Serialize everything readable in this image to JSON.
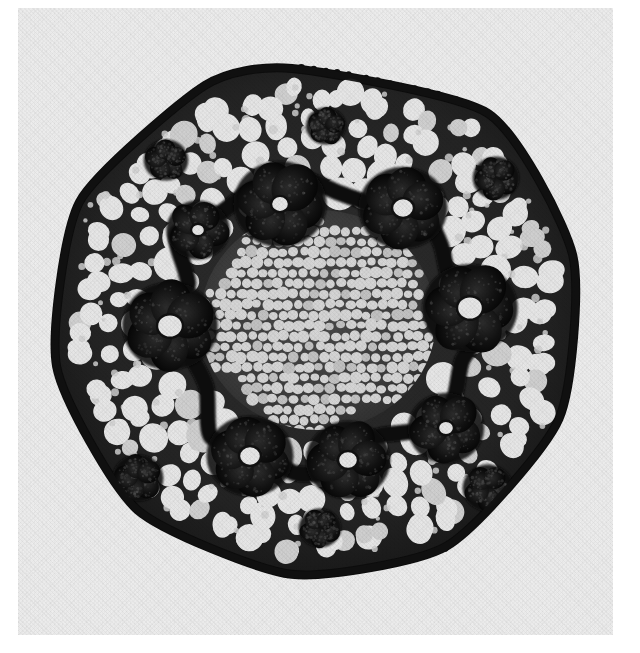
{
  "image": {
    "kind": "photomicrograph",
    "subject": "plant stem cross section",
    "rendering": "monochrome-grayscale",
    "width": 640,
    "height": 653,
    "plate": {
      "x": 18,
      "y": 8,
      "width": 595,
      "height": 627
    },
    "colors": {
      "page": "#ffffff",
      "print_background": "#efefef",
      "print_background_shadow": "#e4e4e4",
      "tissue_mesh_dark": "#141414",
      "tissue_mesh_mid": "#3a3a3a",
      "cortex_cell_lumen": "#e9e9e9",
      "cortex_cell_lumen_shaded": "#d2d2d2",
      "pith_cell_lumen": "#d8d8d8",
      "bundle_dark": "#0b0b0b",
      "bundle_mid": "#262626",
      "epidermis": "#101010"
    }
  },
  "structure": {
    "outline": {
      "name": "stem-outline",
      "shape": "rounded hexagon",
      "center": {
        "x": 300,
        "y": 312
      },
      "radius_x": 268,
      "radius_y": 272,
      "vertices": [
        {
          "angle": -96,
          "r": 0.93
        },
        {
          "angle": -50,
          "r": 0.99
        },
        {
          "angle": -14,
          "r": 0.98
        },
        {
          "angle": 22,
          "r": 0.97
        },
        {
          "angle": 60,
          "r": 0.96
        },
        {
          "angle": 96,
          "r": 0.94
        },
        {
          "angle": 134,
          "r": 0.97
        },
        {
          "angle": 170,
          "r": 0.99
        },
        {
          "angle": 206,
          "r": 0.99
        },
        {
          "angle": 244,
          "r": 0.96
        }
      ]
    },
    "epidermis": {
      "name": "epidermis-ring",
      "thickness": 13,
      "papillae_count": 118,
      "papilla_radius": 3.2
    },
    "hypodermis": {
      "name": "hypodermis-band",
      "thickness": 26,
      "large_cell_count": 34,
      "large_cell_radius": 12
    },
    "cortex": {
      "name": "cortex-parenchyma",
      "inner_fraction": 0.4,
      "outer_fraction": 0.96,
      "cell_radius_min": 9,
      "cell_radius_max": 16,
      "ring_count": 7
    },
    "pith": {
      "name": "pith-fine-parenchyma",
      "radius_x": 118,
      "radius_y": 110,
      "cell_radius_min": 4.2,
      "cell_radius_max": 6.4,
      "row_spacing": 10.5
    },
    "vascular_bundles": {
      "name": "vascular-bundle-ring",
      "count": 14,
      "lobes_per_bundle": 6,
      "note": "dark flower-shaped bundles forming a ring around the pith",
      "positions": [
        {
          "id": "bundle-01",
          "x": 262,
          "y": 196,
          "r": 44,
          "rot": 12,
          "lobes": 6,
          "core": 9
        },
        {
          "id": "bundle-02",
          "x": 385,
          "y": 200,
          "r": 42,
          "rot": 40,
          "lobes": 6,
          "core": 11
        },
        {
          "id": "bundle-03",
          "x": 452,
          "y": 300,
          "r": 45,
          "rot": 5,
          "lobes": 6,
          "core": 13
        },
        {
          "id": "bundle-04",
          "x": 428,
          "y": 420,
          "r": 36,
          "rot": 25,
          "lobes": 5,
          "core": 8
        },
        {
          "id": "bundle-05",
          "x": 330,
          "y": 452,
          "r": 40,
          "rot": 55,
          "lobes": 6,
          "core": 10
        },
        {
          "id": "bundle-06",
          "x": 232,
          "y": 448,
          "r": 41,
          "rot": 18,
          "lobes": 6,
          "core": 11
        },
        {
          "id": "bundle-07",
          "x": 152,
          "y": 318,
          "r": 45,
          "rot": 33,
          "lobes": 6,
          "core": 13
        },
        {
          "id": "bundle-08",
          "x": 180,
          "y": 222,
          "r": 30,
          "rot": 8,
          "lobes": 5,
          "core": 7
        },
        {
          "id": "bundle-09",
          "x": 120,
          "y": 470,
          "r": 24,
          "rot": 44,
          "lobes": 5,
          "core": 0
        },
        {
          "id": "bundle-10",
          "x": 470,
          "y": 480,
          "r": 24,
          "rot": 16,
          "lobes": 5,
          "core": 0
        },
        {
          "id": "bundle-11",
          "x": 478,
          "y": 170,
          "r": 22,
          "rot": 30,
          "lobes": 5,
          "core": 0
        },
        {
          "id": "bundle-12",
          "x": 148,
          "y": 152,
          "r": 21,
          "rot": 52,
          "lobes": 5,
          "core": 0
        },
        {
          "id": "bundle-13",
          "x": 302,
          "y": 520,
          "r": 20,
          "rot": 22,
          "lobes": 5,
          "core": 0
        },
        {
          "id": "bundle-14",
          "x": 308,
          "y": 118,
          "r": 19,
          "rot": 60,
          "lobes": 5,
          "core": 0
        }
      ]
    },
    "dark_connecting_band": {
      "name": "perimedullary-band",
      "note": "irregular dark sclerenchyma band linking the bundle ring around the pith",
      "radius_x": 150,
      "radius_y": 142,
      "thickness": 16
    }
  },
  "chart_data": {
    "type": "heatmap",
    "title": "",
    "note": "not a chart - grayscale photomicrograph",
    "categories": [],
    "values": []
  },
  "annotations": {
    "visible_text": [],
    "scale_bar": null,
    "labels": null,
    "caption": null
  }
}
